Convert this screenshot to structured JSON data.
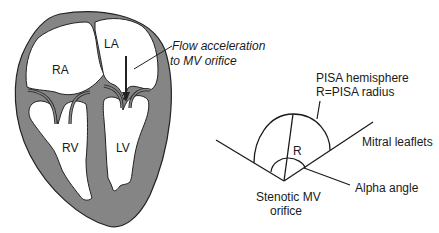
{
  "figure": {
    "heart": {
      "chambers": {
        "ra": "RA",
        "la": "LA",
        "rv": "RV",
        "lv": "LV"
      },
      "flow_label": {
        "line1": "Flow acceleration",
        "line2": "to MV orifice"
      }
    },
    "pisa": {
      "hemisphere_label": {
        "line1": "PISA hemisphere",
        "line2": "R=PISA radius"
      },
      "radius_label": "R",
      "leaflets_label": "Mitral leaflets",
      "alpha_label": "Alpha angle",
      "orifice_label": {
        "line1": "Stenotic MV",
        "line2": "orifice"
      }
    },
    "colors": {
      "wall": "#858585",
      "outline": "#222222",
      "cavity": "#ffffff",
      "line": "#1a1a1a"
    }
  }
}
